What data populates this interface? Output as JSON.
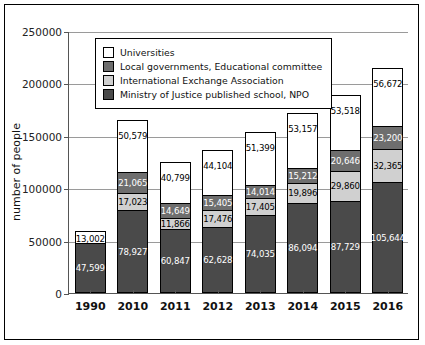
{
  "chart_data": {
    "type": "bar",
    "stacked": true,
    "title": "",
    "xlabel": "",
    "ylabel": "number of people",
    "ylim": [
      0,
      250000
    ],
    "yticks": [
      0,
      50000,
      100000,
      150000,
      200000,
      250000
    ],
    "ytick_labels": [
      "0",
      "50000",
      "100000",
      "150000",
      "200000",
      "250000"
    ],
    "grid": true,
    "legend_position": "upper-left-inside",
    "categories": [
      "1990",
      "2010",
      "2011",
      "2012",
      "2013",
      "2014",
      "2015",
      "2016"
    ],
    "series": [
      {
        "name": "Ministry of Justice published school, NPO",
        "color": "#4a4a4a",
        "values": [
          47599,
          78927,
          60847,
          62628,
          74035,
          86094,
          87729,
          105644
        ],
        "labels": [
          "47,599",
          "78,927",
          "60,847",
          "62,628",
          "74,035",
          "86,094",
          "87,729",
          "105,644"
        ]
      },
      {
        "name": "International Exchange Association",
        "color": "#d0d0d0",
        "values": [
          0,
          17023,
          11866,
          17476,
          17405,
          19896,
          29860,
          32365
        ],
        "labels": [
          "",
          "17,023",
          "11,866",
          "17,476",
          "17,405",
          "19,896",
          "29,860",
          "32,365"
        ]
      },
      {
        "name": "Local governments, Educational committee",
        "color": "#6e6e6e",
        "values": [
          0,
          21065,
          14649,
          15405,
          14014,
          15212,
          20646,
          23200
        ],
        "labels": [
          "",
          "21,065",
          "14,649",
          "15,405",
          "14,014",
          "15,212",
          "20,646",
          "23,200"
        ]
      },
      {
        "name": "Universities",
        "color": "#ffffff",
        "values": [
          13002,
          50579,
          40799,
          44104,
          51399,
          53157,
          53518,
          56672
        ],
        "labels": [
          "13,002",
          "50,579",
          "40,799",
          "44,104",
          "51,399",
          "53,157",
          "53,518",
          "56,672"
        ]
      }
    ]
  },
  "legend": {
    "items": [
      {
        "label": "Universities",
        "color": "#ffffff"
      },
      {
        "label": "Local governments, Educational committee",
        "color": "#6e6e6e"
      },
      {
        "label": "International Exchange Association",
        "color": "#d0d0d0"
      },
      {
        "label": "Ministry of Justice published school, NPO",
        "color": "#4a4a4a"
      }
    ]
  }
}
